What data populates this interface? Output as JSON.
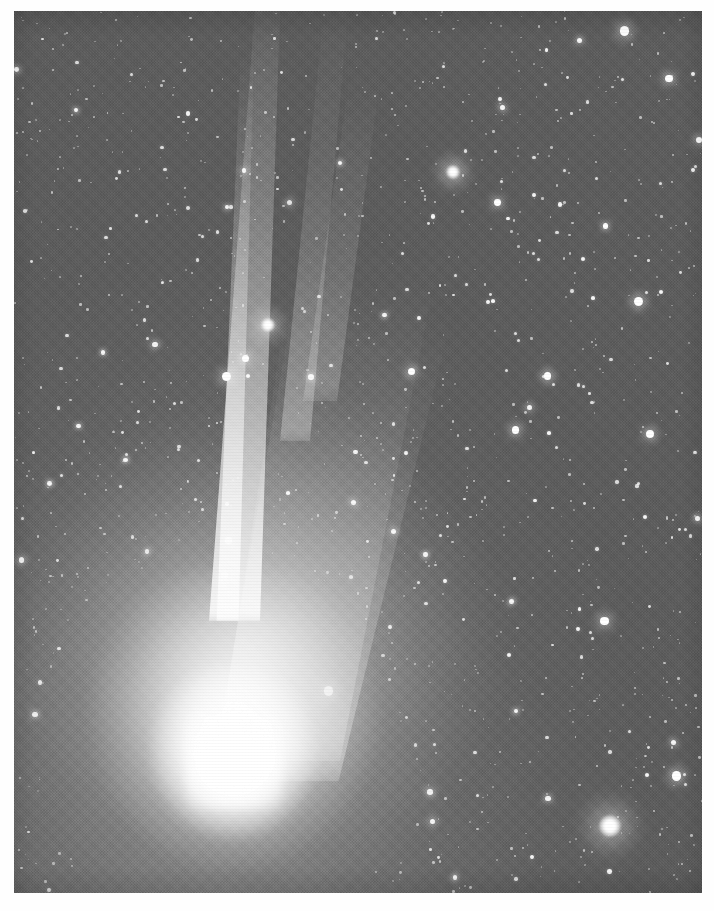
{
  "image": {
    "domain": "Natural-Image",
    "subject": "comet",
    "description": "Black-and-white astronomical photograph of a bright comet with a dense star field background",
    "media_type": "halftone printed photograph scan",
    "alt_text": "A comet with a brilliant teardrop-shaped coma in the lower left and a narrow straight ion tail sweeping to the upper right across a field of stars",
    "caption": "",
    "dimensions": {
      "width": 714,
      "height": 911
    },
    "plate": {
      "left": 14,
      "top": 11,
      "width": 688,
      "height": 882
    }
  },
  "palette": {
    "page_background": "#fefefe",
    "sky_background": "#5e5e5e",
    "sky_light": "#8a8a8a",
    "sky_dark": "#585858",
    "star_white": "#ffffff",
    "coma_white": "#ffffff",
    "tail_glow": "rgba(255,255,255,0.88)"
  },
  "features": [
    {
      "name": "coma",
      "label": "Comet coma",
      "center_x": 215,
      "center_y": 745,
      "radius": 120,
      "brightness": "saturated white"
    },
    {
      "name": "nucleus",
      "label": "Nucleus region",
      "center_x": 220,
      "center_y": 749,
      "radius": 48,
      "brightness": "peak"
    },
    {
      "name": "ion-tail",
      "label": "Ion tail",
      "from_x": 230,
      "from_y": 640,
      "to_x": 330,
      "to_y": 10,
      "width": 28,
      "brightness": "bright narrow streak"
    },
    {
      "name": "dust-tail",
      "label": "Dust tail fan",
      "from_x": 240,
      "from_y": 720,
      "to_x": 420,
      "to_y": 160,
      "width": 180,
      "brightness": "broad diffuse"
    },
    {
      "name": "field-star-bright",
      "label": "Bright foreground star",
      "center_x": 610,
      "center_y": 826,
      "radius": 11
    },
    {
      "name": "field-star-tail",
      "label": "Star projected on the ion tail",
      "center_x": 268,
      "center_y": 325,
      "radius": 7
    },
    {
      "name": "field-star-upper",
      "label": "Bright star upper field",
      "center_x": 453,
      "center_y": 172,
      "radius": 7
    }
  ],
  "star_field": {
    "label": "Background star field",
    "density": "very dense",
    "count_rendered": 1500,
    "note": "Milky Way style field covering the whole plate"
  },
  "texture": {
    "label": "Halftone screen pattern",
    "type": "crossed 45-degree screen with horizontal scan banding"
  },
  "border": {
    "label": "White paper margin",
    "color": "#ffffff",
    "left": 14,
    "top": 11,
    "right": 12,
    "bottom": 18
  }
}
